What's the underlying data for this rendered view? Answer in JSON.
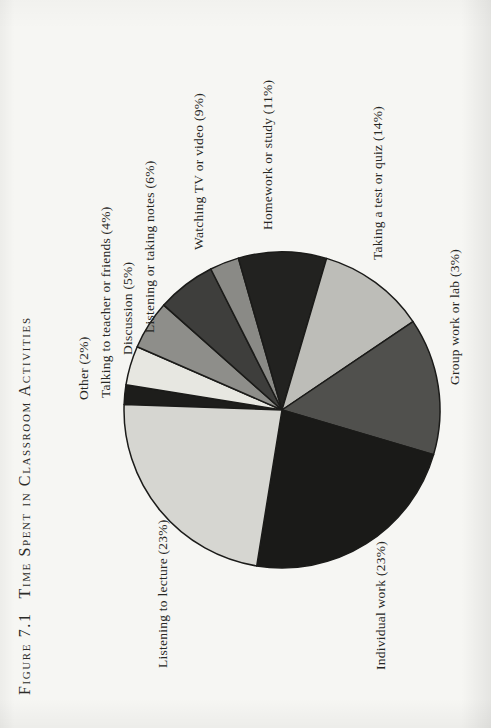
{
  "page": {
    "background": "#f6f6f3",
    "text_color": "#262623"
  },
  "figure": {
    "label": "Figure 7.1",
    "caption": "Time Spent in Classroom Activities"
  },
  "chart_data": {
    "type": "pie",
    "legend_position": "labels-around-pie",
    "start_angle_deg": 2,
    "center": {
      "x": 318,
      "y": 282
    },
    "radius": 158,
    "stroke_color": "#1b1b19",
    "stroke_width": 1.5,
    "slices": [
      {
        "label": "Other (2%)",
        "category": "Other",
        "pct": 2,
        "color": "#1d1d1b",
        "label_x": 328,
        "label_y": 85
      },
      {
        "label": "Talking to teacher or friends (4%)",
        "category": "Talking to teacher or friends",
        "pct": 4,
        "color": "#e7e7e1",
        "label_x": 330,
        "label_y": 107
      },
      {
        "label": "Discussion (5%)",
        "category": "Discussion",
        "pct": 5,
        "color": "#8e8e8a",
        "label_x": 373,
        "label_y": 129
      },
      {
        "label": "Listening or taking notes (6%)",
        "category": "Listening or taking notes",
        "pct": 6,
        "color": "#3e3e3c",
        "label_x": 395,
        "label_y": 151
      },
      {
        "label": "Group work or lab (3%)",
        "category": "Group work or lab",
        "pct": 3,
        "color": "#8a8a86",
        "label_x": 343,
        "label_y": 456
      },
      {
        "label": "Watching TV or video (9%)",
        "category": "Watching TV or video",
        "pct": 9,
        "color": "#222220",
        "label_x": 478,
        "label_y": 200
      },
      {
        "label": "Homework or study (11%)",
        "category": "Homework or study",
        "pct": 11,
        "color": "#bdbdb8",
        "label_x": 498,
        "label_y": 269
      },
      {
        "label": "Taking a test or quiz (14%)",
        "category": "Taking a test or quiz",
        "pct": 14,
        "color": "#50504d",
        "label_x": 468,
        "label_y": 379
      },
      {
        "label": "Individual work (23%)",
        "category": "Individual work",
        "pct": 23,
        "color": "#1a1a18",
        "label_x": 58,
        "label_y": 382
      },
      {
        "label": "Listening to lecture (23%)",
        "category": "Listening to lecture",
        "pct": 23,
        "color": "#d6d6d1",
        "label_x": 60,
        "label_y": 164
      }
    ]
  }
}
